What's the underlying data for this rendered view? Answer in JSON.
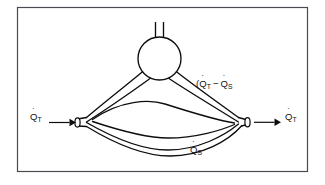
{
  "figure": {
    "background_color": "#ffffff",
    "frame": {
      "name": "figure-border",
      "stroke_color": "#4a4a52"
    },
    "line_color": "#0d0d0d",
    "labels": {
      "inlet": {
        "symbol": "Q",
        "subscript": "T",
        "prefix": "",
        "suffix": "",
        "full_text": "Q̇T"
      },
      "outlet": {
        "symbol": "Q",
        "subscript": "T",
        "prefix": "",
        "suffix": "",
        "full_text": "Q̇T"
      },
      "shunt": {
        "symbol": "Q",
        "subscript": "S",
        "prefix": "",
        "suffix": "",
        "full_text": "Q̇S"
      },
      "branch": {
        "prefix": "(",
        "symbol_1": "Q",
        "subscript_1": "T",
        "operator": "−",
        "symbol_2": "Q",
        "subscript_2": "S",
        "suffix": "",
        "full_text": "(Q̇T − Q̇S"
      }
    },
    "parts": {
      "bulb": "circular-chamber",
      "stem": "vertical-neck-tube",
      "inlet_port": "tube-opening-left",
      "outlet_port": "tube-opening-right",
      "upper_channel": "branch-to-chamber",
      "inner_channel": "inner-lens-vessel",
      "lower_channel": "shunt-vessel"
    }
  }
}
